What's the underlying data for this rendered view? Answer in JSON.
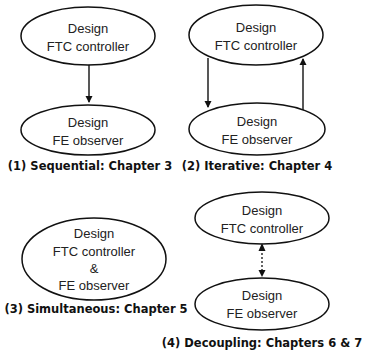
{
  "diagram": {
    "stroke_color": "#111111",
    "panels": [
      {
        "caption": "(1) Sequential: Chapter 3",
        "nodes": [
          {
            "line1": "Design",
            "line2": "FTC controller"
          },
          {
            "line1": "Design",
            "line2": "FE observer"
          }
        ],
        "edges": [
          {
            "from": "FTC controller",
            "to": "FE observer",
            "style": "solid"
          }
        ]
      },
      {
        "caption": "(2) Iterative: Chapter 4",
        "nodes": [
          {
            "line1": "Design",
            "line2": "FTC controller"
          },
          {
            "line1": "Design",
            "line2": "FE observer"
          }
        ],
        "edges": [
          {
            "from": "FTC controller",
            "to": "FE observer",
            "style": "solid"
          },
          {
            "from": "FE observer",
            "to": "FTC controller",
            "style": "solid"
          }
        ]
      },
      {
        "caption": "(3) Simultaneous: Chapter 5",
        "nodes": [
          {
            "line1": "Design",
            "line2": "FTC controller",
            "line3": "&",
            "line4": "FE observer"
          }
        ],
        "edges": []
      },
      {
        "caption": "(4) Decoupling: Chapters 6 & 7",
        "nodes": [
          {
            "line1": "Design",
            "line2": "FTC controller"
          },
          {
            "line1": "Design",
            "line2": "FE observer"
          }
        ],
        "edges": [
          {
            "from": "FTC controller",
            "to": "FE observer",
            "style": "dotted-bidirectional"
          }
        ]
      }
    ]
  }
}
